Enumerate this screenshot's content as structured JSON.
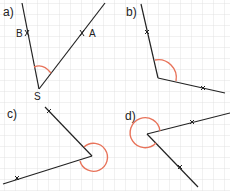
{
  "grid": {
    "spacing": 11,
    "color": "#d9d9d9"
  },
  "colors": {
    "line": "#222222",
    "arc": "#e8735a"
  },
  "panels": [
    {
      "id": "a",
      "label": "a)",
      "points": {
        "B": "B",
        "A": "A",
        "S": "S"
      }
    },
    {
      "id": "b",
      "label": "b)"
    },
    {
      "id": "c",
      "label": "c)"
    },
    {
      "id": "d",
      "label": "d)"
    }
  ]
}
